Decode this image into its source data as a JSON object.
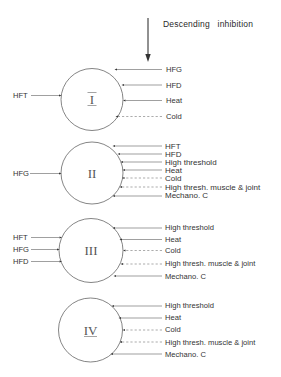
{
  "header": {
    "descending_label": "Descending   inhibition"
  },
  "units": [
    {
      "numeral": "I",
      "left_inputs": [
        "HFT"
      ],
      "right_inputs": [
        {
          "label": "HFG",
          "style": "solid"
        },
        {
          "label": "HFD",
          "style": "solid"
        },
        {
          "label": "Heat",
          "style": "solid"
        },
        {
          "label": "Cold",
          "style": "dashed"
        }
      ]
    },
    {
      "numeral": "II",
      "left_inputs": [
        "HFG"
      ],
      "right_inputs": [
        {
          "label": "HFT",
          "style": "solid"
        },
        {
          "label": "HFD",
          "style": "solid"
        },
        {
          "label": "High threshold",
          "style": "solid"
        },
        {
          "label": "Heat",
          "style": "solid"
        },
        {
          "label": "Cold",
          "style": "dashed"
        },
        {
          "label": "High thresh. muscle & joint",
          "style": "dashed"
        },
        {
          "label": "Mechano. C",
          "style": "solid"
        }
      ]
    },
    {
      "numeral": "III",
      "left_inputs": [
        "HFT",
        "HFG",
        "HFD"
      ],
      "right_inputs": [
        {
          "label": "High threshold",
          "style": "solid"
        },
        {
          "label": "Heat",
          "style": "solid"
        },
        {
          "label": "Cold",
          "style": "dashed"
        },
        {
          "label": "High thresh. muscle & joint",
          "style": "dashed"
        },
        {
          "label": "Mechano. C",
          "style": "solid"
        }
      ]
    },
    {
      "numeral": "IV",
      "left_inputs": [],
      "right_inputs": [
        {
          "label": "High threshold",
          "style": "solid"
        },
        {
          "label": "Heat",
          "style": "solid"
        },
        {
          "label": "Cold",
          "style": "dashed"
        },
        {
          "label": "High thresh. muscle & joint",
          "style": "dashed"
        },
        {
          "label": "Mechano. C",
          "style": "solid"
        }
      ]
    }
  ]
}
